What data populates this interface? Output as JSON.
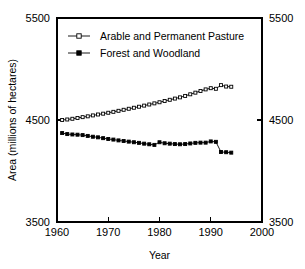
{
  "chart_data": {
    "type": "line",
    "title": "",
    "xlabel": "Year",
    "ylabel": "Area (millions of hectares)",
    "xlim": [
      1960,
      2000
    ],
    "ylim": [
      3500,
      5500
    ],
    "xticks": [
      1960,
      1970,
      1980,
      1990,
      2000
    ],
    "yticks": [
      3500,
      4500,
      5500
    ],
    "xtick_labels": [
      "1960",
      "1970",
      "1980",
      "1990",
      "2000"
    ],
    "ytick_labels": [
      "3500",
      "4500",
      "5500"
    ],
    "ytick_labels_right": [
      "3500",
      "4500",
      "5500"
    ],
    "grid": false,
    "legend_position": "upper-center",
    "mirrored_y_axis": true,
    "series": [
      {
        "name": "Arable and Permanent Pasture",
        "marker": "open-square",
        "x": [
          1961,
          1962,
          1963,
          1964,
          1965,
          1966,
          1967,
          1968,
          1969,
          1970,
          1971,
          1972,
          1973,
          1974,
          1975,
          1976,
          1977,
          1978,
          1979,
          1980,
          1981,
          1982,
          1983,
          1984,
          1985,
          1986,
          1987,
          1988,
          1989,
          1990,
          1991,
          1992,
          1993,
          1994
        ],
        "values": [
          4500,
          4505,
          4512,
          4520,
          4528,
          4536,
          4545,
          4554,
          4562,
          4571,
          4580,
          4590,
          4600,
          4610,
          4620,
          4630,
          4641,
          4652,
          4663,
          4674,
          4686,
          4698,
          4710,
          4722,
          4736,
          4752,
          4768,
          4784,
          4800,
          4812,
          4806,
          4842,
          4828,
          4826
        ]
      },
      {
        "name": "Forest and Woodland",
        "marker": "filled-square",
        "x": [
          1961,
          1962,
          1963,
          1964,
          1965,
          1966,
          1967,
          1968,
          1969,
          1970,
          1971,
          1972,
          1973,
          1974,
          1975,
          1976,
          1977,
          1978,
          1979,
          1980,
          1981,
          1982,
          1983,
          1984,
          1985,
          1986,
          1987,
          1988,
          1989,
          1990,
          1991,
          1992,
          1993,
          1994
        ],
        "values": [
          4372,
          4362,
          4358,
          4356,
          4352,
          4344,
          4336,
          4330,
          4322,
          4314,
          4308,
          4300,
          4294,
          4288,
          4282,
          4276,
          4268,
          4262,
          4256,
          4282,
          4272,
          4268,
          4264,
          4262,
          4264,
          4270,
          4276,
          4278,
          4278,
          4290,
          4286,
          4186,
          4184,
          4180
        ]
      }
    ]
  },
  "legend": {
    "entries": [
      {
        "label": "Arable and Permanent Pasture",
        "marker": "open-square"
      },
      {
        "label": "Forest and Woodland",
        "marker": "filled-square"
      }
    ]
  },
  "colors": {
    "background": "#ffffff",
    "foreground": "#000000"
  }
}
